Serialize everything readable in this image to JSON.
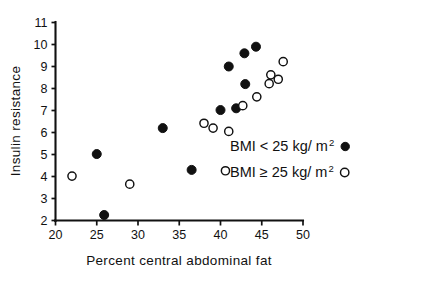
{
  "chart_data": {
    "type": "scatter",
    "title": "",
    "xlabel": "Percent central abdominal fat",
    "ylabel": "Insulin resistance",
    "xlim": [
      20,
      50
    ],
    "ylim": [
      2,
      11
    ],
    "xticks": [
      "20",
      "25",
      "30",
      "35",
      "40",
      "45",
      "50"
    ],
    "yticks": [
      "2",
      "3",
      "4",
      "5",
      "6",
      "7",
      "8",
      "9",
      "10",
      "11"
    ],
    "grid": false,
    "legend_position": "right-middle",
    "series": [
      {
        "name": "BMI < 25 kg/ m2",
        "marker": "filled-circle",
        "color": "#111111",
        "points": [
          [
            25.9,
            2.25
          ],
          [
            25.0,
            5.02
          ],
          [
            36.5,
            4.3
          ],
          [
            33.0,
            6.2
          ],
          [
            40.0,
            7.02
          ],
          [
            41.9,
            7.1
          ],
          [
            41.0,
            9.0
          ],
          [
            43.0,
            8.2
          ],
          [
            42.9,
            9.6
          ],
          [
            44.3,
            9.9
          ]
        ]
      },
      {
        "name": "BMI >= 25 kg/ m2",
        "marker": "open-circle",
        "color": "#111111",
        "points": [
          [
            22.0,
            4.02
          ],
          [
            29.0,
            3.65
          ],
          [
            40.6,
            4.26
          ],
          [
            41.0,
            6.05
          ],
          [
            38.0,
            6.42
          ],
          [
            39.1,
            6.2
          ],
          [
            42.7,
            7.22
          ],
          [
            44.4,
            7.62
          ],
          [
            45.9,
            8.22
          ],
          [
            46.1,
            8.62
          ],
          [
            47.0,
            8.42
          ],
          [
            47.6,
            9.22
          ]
        ]
      }
    ]
  },
  "legend": {
    "entries": [
      {
        "label_main": "BMI < 25 kg/ m",
        "label_sup": "2",
        "marker": "filled-circle"
      },
      {
        "label_main": "BMI ≥ 25 kg/ m",
        "label_sup": "2",
        "marker": "open-circle"
      }
    ]
  },
  "axes": {
    "x_title": "Percent central abdominal fat",
    "y_title": "Insulin resistance"
  }
}
